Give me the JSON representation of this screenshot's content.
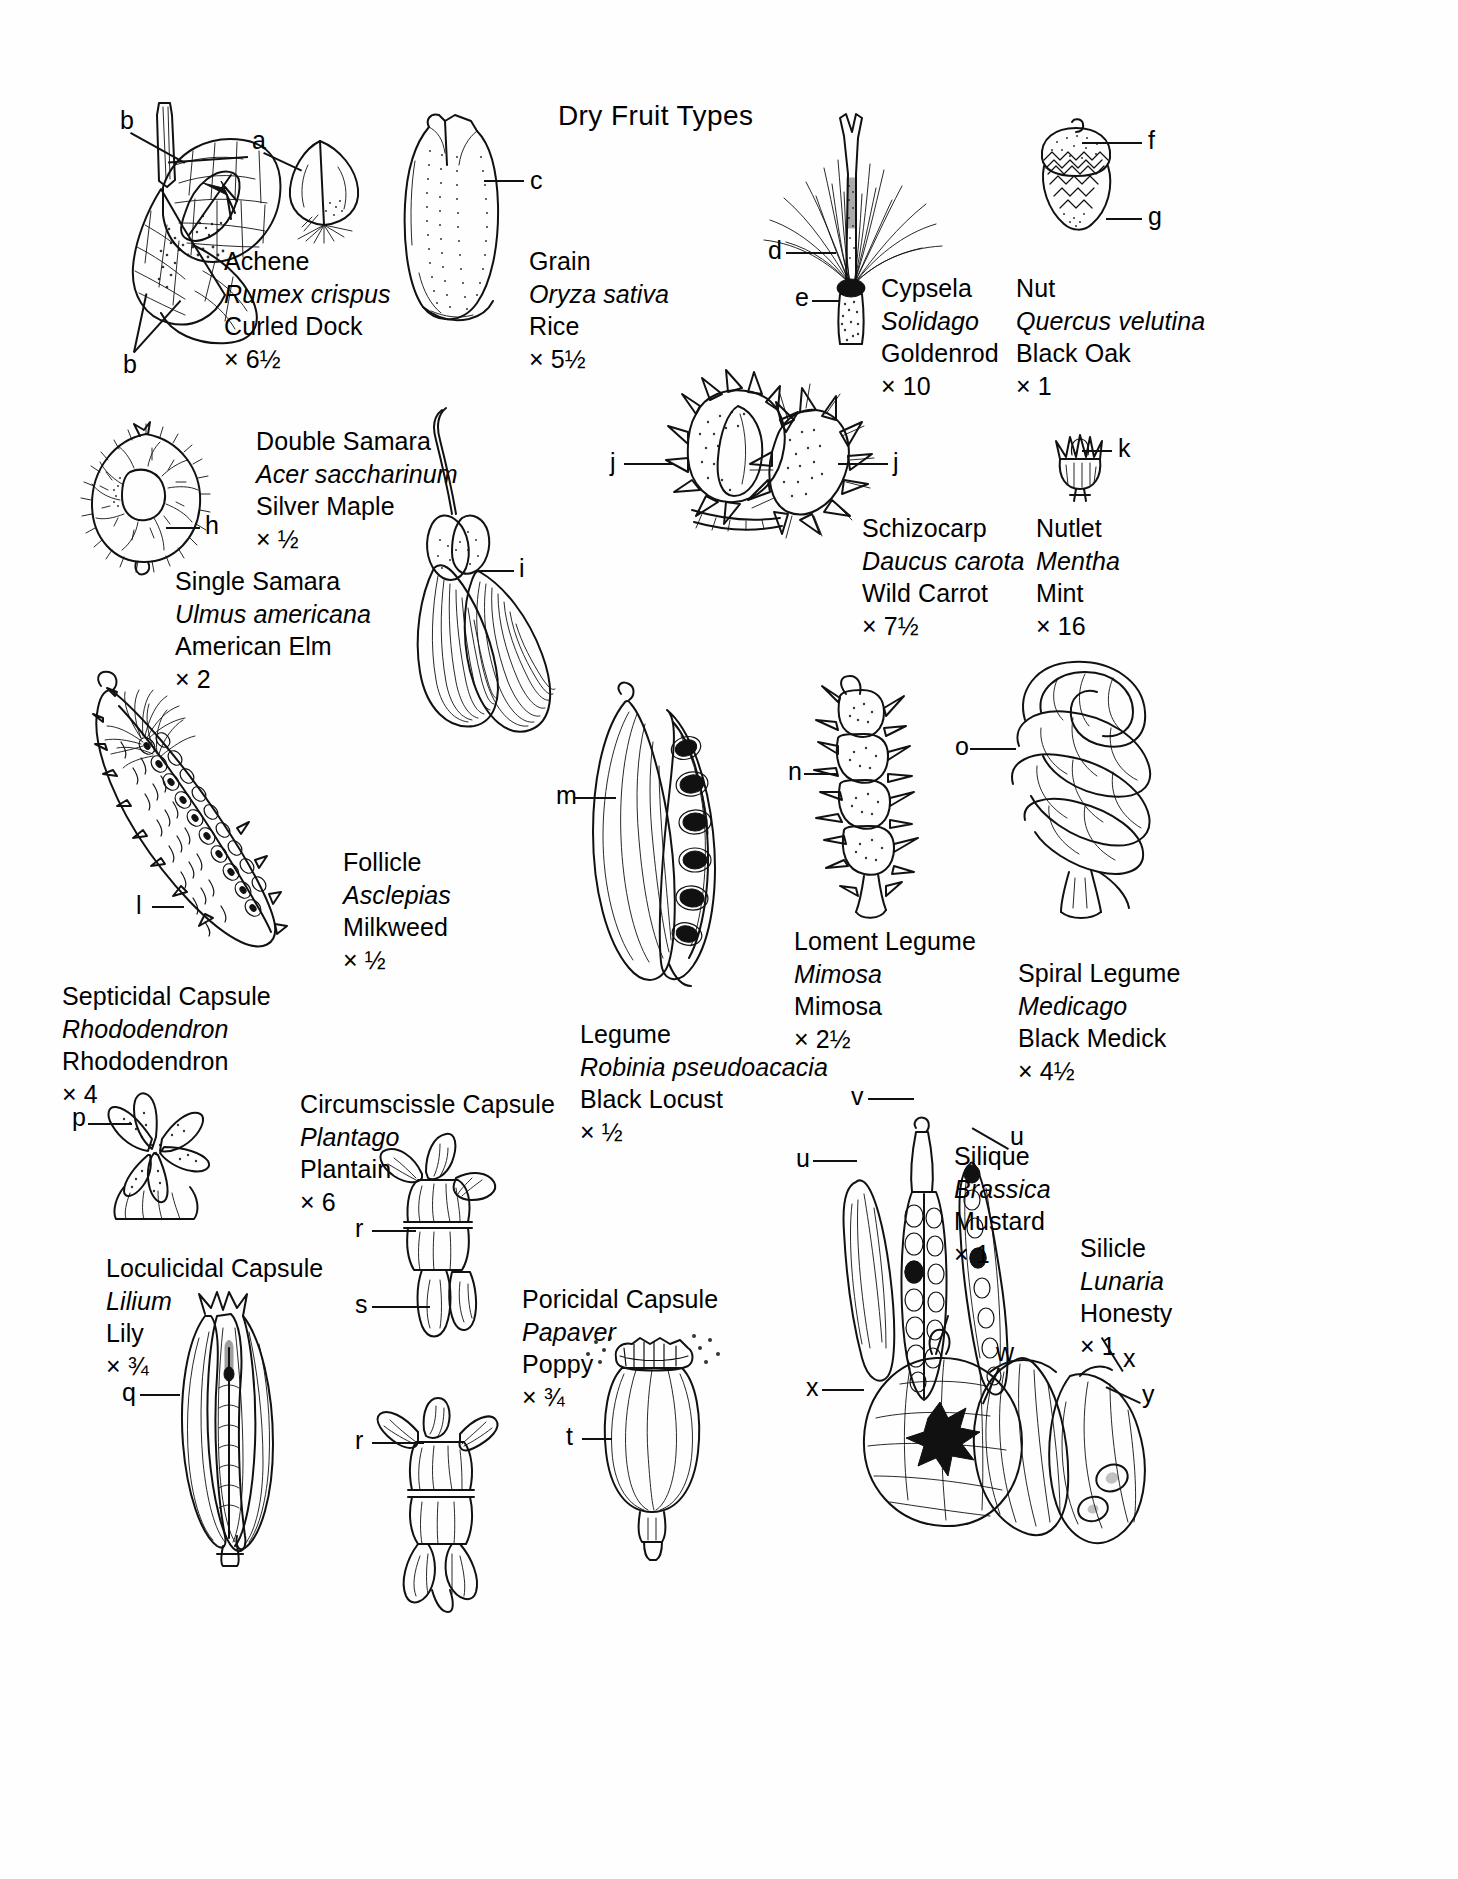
{
  "plate": {
    "title": "Dry Fruit Types",
    "background_color": "#ffffff",
    "ink_color": "#111111"
  },
  "specimens": [
    {
      "id": "achene",
      "type": "Achene",
      "scientific_name": "Rumex crispus",
      "common_name": "Curled Dock",
      "magnification": "× 6½",
      "leader_labels": [
        "b",
        "a",
        "b"
      ]
    },
    {
      "id": "grain",
      "type": "Grain",
      "scientific_name": "Oryza sativa",
      "common_name": "Rice",
      "magnification": "× 5½",
      "leader_labels": [
        "c"
      ]
    },
    {
      "id": "cypsela",
      "type": "Cypsela",
      "scientific_name": "Solidago",
      "common_name": "Goldenrod",
      "magnification": "× 10",
      "leader_labels": [
        "d",
        "e"
      ]
    },
    {
      "id": "nut",
      "type": "Nut",
      "scientific_name": "Quercus velutina",
      "common_name": "Black Oak",
      "magnification": "× 1",
      "leader_labels": [
        "f",
        "g"
      ]
    },
    {
      "id": "double-samara",
      "type": "Double Samara",
      "scientific_name": "Acer saccharinum",
      "common_name": "Silver Maple",
      "magnification": "× ½",
      "leader_labels": [
        "i"
      ]
    },
    {
      "id": "single-samara",
      "type": "Single Samara",
      "scientific_name": "Ulmus americana",
      "common_name": "American Elm",
      "magnification": "× 2",
      "leader_labels": [
        "h"
      ]
    },
    {
      "id": "schizocarp",
      "type": "Schizocarp",
      "scientific_name": "Daucus carota",
      "common_name": "Wild Carrot",
      "magnification": "× 7½",
      "leader_labels": [
        "j",
        "j"
      ]
    },
    {
      "id": "nutlet",
      "type": "Nutlet",
      "scientific_name": "Mentha",
      "common_name": "Mint",
      "magnification": "× 16",
      "leader_labels": [
        "k"
      ]
    },
    {
      "id": "follicle",
      "type": "Follicle",
      "scientific_name": "Asclepias",
      "common_name": "Milkweed",
      "magnification": "× ½",
      "leader_labels": [
        "l"
      ]
    },
    {
      "id": "legume",
      "type": "Legume",
      "scientific_name": "Robinia pseudoacacia",
      "common_name": "Black Locust",
      "magnification": "× ½",
      "leader_labels": [
        "m"
      ]
    },
    {
      "id": "loment-legume",
      "type": "Loment Legume",
      "scientific_name": "Mimosa",
      "common_name": "Mimosa",
      "magnification": "× 2½",
      "leader_labels": [
        "n"
      ]
    },
    {
      "id": "spiral-legume",
      "type": "Spiral Legume",
      "scientific_name": "Medicago",
      "common_name": "Black Medick",
      "magnification": "× 4½",
      "leader_labels": [
        "o"
      ]
    },
    {
      "id": "septicidal-capsule",
      "type": "Septicidal Capsule",
      "scientific_name": "Rhododendron",
      "common_name": "Rhododendron",
      "magnification": "× 4",
      "leader_labels": [
        "p"
      ]
    },
    {
      "id": "loculicidal-capsule",
      "type": "Loculicidal Capsule",
      "scientific_name": "Lilium",
      "common_name": "Lily",
      "magnification": "× ¾",
      "leader_labels": [
        "q"
      ]
    },
    {
      "id": "circumscissle-capsule",
      "type": "Circumscissle Capsule",
      "scientific_name": "Plantago",
      "common_name": "Plantain",
      "magnification": "× 6",
      "leader_labels": [
        "r",
        "s",
        "r"
      ]
    },
    {
      "id": "poricidal-capsule",
      "type": "Poricidal Capsule",
      "scientific_name": "Papaver",
      "common_name": "Poppy",
      "magnification": "× ¾",
      "leader_labels": [
        "t"
      ]
    },
    {
      "id": "silique",
      "type": "Silique",
      "scientific_name": "Brassica",
      "common_name": "Mustard",
      "magnification": "× 1",
      "leader_labels": [
        "u",
        "v",
        "u"
      ]
    },
    {
      "id": "silicle",
      "type": "Silicle",
      "scientific_name": "Lunaria",
      "common_name": "Honesty",
      "magnification": "× 1",
      "leader_labels": [
        "w",
        "x",
        "x",
        "y"
      ]
    }
  ],
  "leader_letters": {
    "a": "a",
    "b1": "b",
    "b2": "b",
    "c": "c",
    "d": "d",
    "e": "e",
    "f": "f",
    "g": "g",
    "h": "h",
    "i": "i",
    "j1": "j",
    "j2": "j",
    "k": "k",
    "l": "l",
    "m": "m",
    "n": "n",
    "o": "o",
    "p": "p",
    "q": "q",
    "r1": "r",
    "r2": "r",
    "s": "s",
    "t": "t",
    "u1": "u",
    "u2": "u",
    "v": "v",
    "w": "w",
    "x1": "x",
    "x2": "x",
    "y": "y"
  }
}
